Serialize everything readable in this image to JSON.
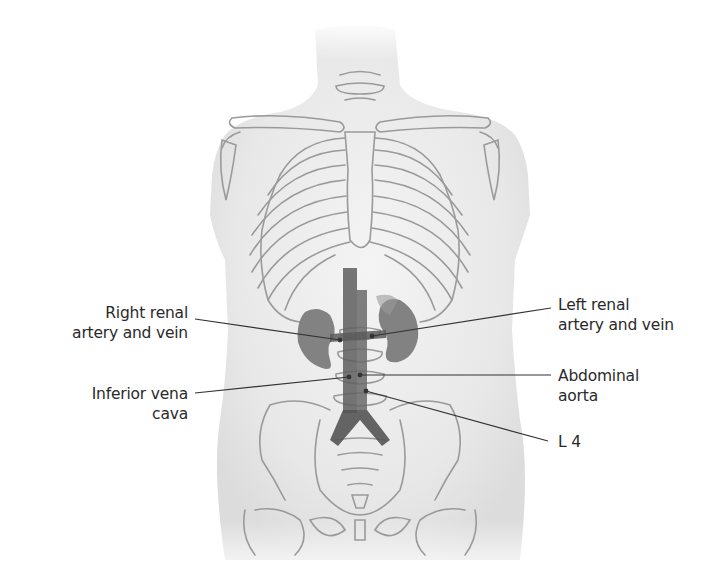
{
  "figure": {
    "colors": {
      "background": "#ffffff",
      "body_fill": "#ececec",
      "bone_stroke": "#9a9a9a",
      "organ_fill": "#6f6f6f",
      "vessel_fill": "#5a5a5a",
      "leader_line": "#333333",
      "label_text": "#2a2a2a"
    }
  },
  "labels": {
    "right_renal": {
      "line1": "Right renal",
      "line2": "artery and vein"
    },
    "inferior_vena_cava": {
      "line1": "Inferior vena",
      "line2": "cava"
    },
    "left_renal": {
      "line1": "Left renal",
      "line2": "artery and vein"
    },
    "abdominal_aorta": {
      "line1": "Abdominal",
      "line2": "aorta"
    },
    "l4": {
      "line1": "L 4"
    }
  }
}
